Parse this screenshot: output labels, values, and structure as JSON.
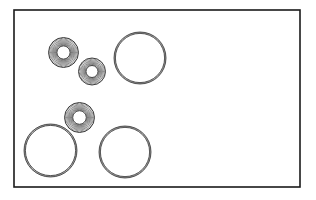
{
  "figure": {
    "canvas": {
      "width": 316,
      "height": 200,
      "background": "#ffffff"
    },
    "frame": {
      "label": "rectangular-border",
      "x": 14,
      "y": 10,
      "width": 286,
      "height": 177,
      "stroke": "#1a1a1a",
      "stroke_width": 1.6,
      "fill": "#ffffff"
    },
    "styles": {
      "outline_stroke": "#2b2b2b",
      "hatch_stroke": "#333333",
      "ring_band_stroke": "#3a3a3a",
      "interior_fill": "#ffffff"
    },
    "chart_data": {
      "type": "scatter",
      "title": "Hatched annuli and plain circles within a rectangular frame",
      "xlabel": "",
      "ylabel": "",
      "xlim": [
        14,
        300
      ],
      "ylim": [
        10,
        187
      ],
      "grid": false,
      "legend": "none",
      "series": [
        {
          "name": "hatched-annulus",
          "shape": "annulus",
          "hatch": "radial",
          "count": 3,
          "points": [
            {
              "id": "annulus-1",
              "cx": 63.5,
              "cy": 52.5,
              "r_outer": 15.0,
              "r_inner": 6.6
            },
            {
              "id": "annulus-2",
              "cx": 92.0,
              "cy": 71.5,
              "r_outer": 13.5,
              "r_inner": 6.0
            },
            {
              "id": "annulus-3",
              "cx": 79.5,
              "cy": 117.5,
              "r_outer": 15.0,
              "r_inner": 6.8
            }
          ]
        },
        {
          "name": "plain-circle",
          "shape": "circle",
          "hatch": "none",
          "count": 3,
          "points": [
            {
              "id": "circle-1",
              "cx": 140.0,
              "cy": 58.0,
              "r_outer": 26.0,
              "r_inner": 24.6
            },
            {
              "id": "circle-2",
              "cx": 50.5,
              "cy": 150.5,
              "r_outer": 26.5,
              "r_inner": 25.1
            },
            {
              "id": "circle-3",
              "cx": 125.0,
              "cy": 152.0,
              "r_outer": 26.0,
              "r_inner": 24.6
            }
          ]
        }
      ]
    }
  }
}
